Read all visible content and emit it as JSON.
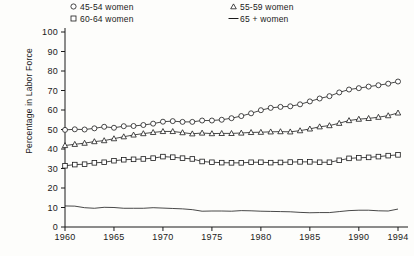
{
  "chart_data": {
    "type": "line",
    "title": "",
    "xlabel": "",
    "ylabel": "Percentage in Labor Force",
    "xlim": [
      1960,
      1994
    ],
    "ylim": [
      0,
      100
    ],
    "grid": false,
    "legend_position": "top",
    "x": [
      1960,
      1961,
      1962,
      1963,
      1964,
      1965,
      1966,
      1967,
      1968,
      1969,
      1970,
      1971,
      1972,
      1973,
      1974,
      1975,
      1976,
      1977,
      1978,
      1979,
      1980,
      1981,
      1982,
      1983,
      1984,
      1985,
      1986,
      1987,
      1988,
      1989,
      1990,
      1991,
      1992,
      1993,
      1994
    ],
    "xticks": [
      "1960",
      "1965",
      "1970",
      "1975",
      "1980",
      "1985",
      "1990",
      "1994"
    ],
    "xtick_values": [
      1960,
      1965,
      1970,
      1975,
      1980,
      1985,
      1990,
      1994
    ],
    "yticks": [
      "0",
      "10",
      "20",
      "30",
      "40",
      "50",
      "60",
      "70",
      "80",
      "90",
      "100"
    ],
    "ytick_values": [
      0,
      10,
      20,
      30,
      40,
      50,
      60,
      70,
      80,
      90,
      100
    ],
    "series": [
      {
        "name": "45-54 women",
        "marker": "circle",
        "legend_symbol": "o",
        "values": [
          49.8,
          50.1,
          50.0,
          50.6,
          51.4,
          50.9,
          51.7,
          51.8,
          52.3,
          53.0,
          54.0,
          54.3,
          53.9,
          53.9,
          54.6,
          54.6,
          55.0,
          55.8,
          56.9,
          58.3,
          59.9,
          61.1,
          61.6,
          61.9,
          62.9,
          64.4,
          65.9,
          67.1,
          69.0,
          70.5,
          71.2,
          72.0,
          72.7,
          73.5,
          74.6
        ]
      },
      {
        "name": "55-59 women",
        "marker": "triangle",
        "legend_symbol": "△",
        "values": [
          41.8,
          42.4,
          43.0,
          43.8,
          44.3,
          45.3,
          46.3,
          47.2,
          47.9,
          48.5,
          49.0,
          49.0,
          48.4,
          47.8,
          48.2,
          47.9,
          48.0,
          48.0,
          48.2,
          48.5,
          48.6,
          48.8,
          48.9,
          48.8,
          49.4,
          50.3,
          51.4,
          52.0,
          53.2,
          54.6,
          55.3,
          55.7,
          56.3,
          57.1,
          58.5
        ]
      },
      {
        "name": "60-64 women",
        "marker": "square",
        "legend_symbol": "□",
        "values": [
          31.4,
          32.0,
          32.2,
          32.9,
          33.2,
          34.0,
          34.5,
          34.7,
          34.9,
          35.3,
          36.1,
          35.8,
          35.3,
          34.9,
          33.6,
          33.2,
          33.0,
          32.9,
          32.9,
          33.2,
          33.2,
          33.0,
          33.1,
          33.3,
          33.4,
          33.4,
          33.2,
          33.2,
          34.2,
          35.2,
          35.5,
          35.7,
          36.1,
          36.6,
          37.0
        ]
      },
      {
        "name": "65 + women",
        "marker": "none",
        "legend_symbol": "—",
        "values": [
          10.8,
          10.7,
          9.9,
          9.6,
          10.1,
          10.0,
          9.6,
          9.6,
          9.6,
          9.9,
          9.7,
          9.5,
          9.3,
          8.9,
          8.1,
          8.2,
          8.2,
          8.1,
          8.4,
          8.3,
          8.1,
          8.0,
          7.9,
          7.8,
          7.5,
          7.3,
          7.4,
          7.4,
          7.9,
          8.4,
          8.6,
          8.6,
          8.3,
          8.2,
          9.2
        ]
      }
    ]
  },
  "legend": {
    "columns": [
      {
        "entries": [
          "45-54 women",
          "60-64 women"
        ]
      },
      {
        "entries": [
          "55-59 women",
          "65 + women"
        ]
      }
    ]
  }
}
